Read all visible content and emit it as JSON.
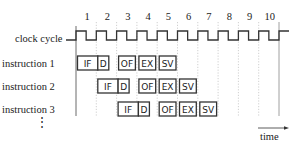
{
  "diagram": {
    "cycle_numbers": [
      "1",
      "2",
      "3",
      "4",
      "5",
      "6",
      "7",
      "8",
      "9",
      "10"
    ],
    "clock_label": "clock cycle",
    "instructions": [
      {
        "label": "instruction 1",
        "stages": [
          {
            "name": "IF",
            "cycle": 1
          },
          {
            "name": "D",
            "cycle": 2
          },
          {
            "name": "OF",
            "cycle": 3
          },
          {
            "name": "EX",
            "cycle": 4
          },
          {
            "name": "SV",
            "cycle": 5
          }
        ]
      },
      {
        "label": "instruction 2",
        "stages": [
          {
            "name": "IF",
            "cycle": 2
          },
          {
            "name": "D",
            "cycle": 3
          },
          {
            "name": "OF",
            "cycle": 4
          },
          {
            "name": "EX",
            "cycle": 5
          },
          {
            "name": "SV",
            "cycle": 6
          }
        ]
      },
      {
        "label": "instruction 3",
        "stages": [
          {
            "name": "IF",
            "cycle": 3
          },
          {
            "name": "D",
            "cycle": 4
          },
          {
            "name": "OF",
            "cycle": 5
          },
          {
            "name": "EX",
            "cycle": 6
          },
          {
            "name": "SV",
            "cycle": 7
          }
        ]
      }
    ],
    "ellipsis": "⋮",
    "time_label": "time",
    "colors": {
      "stroke": "#222222",
      "grid": "#bbbbbb"
    }
  }
}
